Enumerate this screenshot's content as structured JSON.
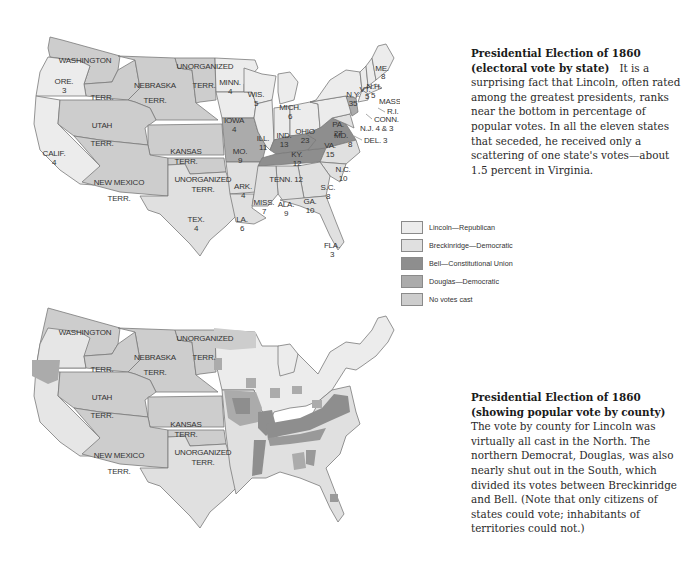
{
  "top_map": {
    "title": "Presidential Election of 1860 (electoral vote by state)",
    "caption_title": "Presidential Election of 1860 (electoral vote by state)",
    "caption_body": "It is a surprising fact that Lincoln, often rated among the greatest presidents, ranks near the bottom in percentage of popular votes. In all the eleven states that seceded, he received only a scattering of one state's votes—about 1.5 percent in Virginia.",
    "territories": [
      {
        "name": "WASHINGTON",
        "line2": "TERR."
      },
      {
        "name": "NEBRASKA",
        "line2": "TERR."
      },
      {
        "name": "UNORGANIZED",
        "line2": "TERR."
      },
      {
        "name": "UTAH",
        "line2": "TERR."
      },
      {
        "name": "KANSAS",
        "line2": "TERR."
      },
      {
        "name": "NEW MEXICO",
        "line2": "TERR."
      },
      {
        "name": "UNORGANIZED",
        "line2": "TERR."
      }
    ],
    "states": [
      {
        "abbr": "ORE.",
        "votes": "3",
        "winner": "Lincoln"
      },
      {
        "abbr": "CALIF.",
        "votes": "4",
        "winner": "Lincoln"
      },
      {
        "abbr": "MINN.",
        "votes": "4",
        "winner": "Lincoln"
      },
      {
        "abbr": "WIS.",
        "votes": "5",
        "winner": "Lincoln"
      },
      {
        "abbr": "IOWA",
        "votes": "4",
        "winner": "Lincoln"
      },
      {
        "abbr": "MICH.",
        "votes": "6",
        "winner": "Lincoln"
      },
      {
        "abbr": "ILL.",
        "votes": "11",
        "winner": "Lincoln"
      },
      {
        "abbr": "IND.",
        "votes": "13",
        "winner": "Lincoln"
      },
      {
        "abbr": "OHIO",
        "votes": "23",
        "winner": "Lincoln"
      },
      {
        "abbr": "PA.",
        "votes": "27",
        "winner": "Lincoln"
      },
      {
        "abbr": "N.Y.",
        "votes": "35",
        "winner": "Lincoln"
      },
      {
        "abbr": "VT.",
        "votes": "5",
        "winner": "Lincoln"
      },
      {
        "abbr": "N.H.",
        "votes": "5",
        "winner": "Lincoln"
      },
      {
        "abbr": "ME.",
        "votes": "8",
        "winner": "Lincoln"
      },
      {
        "abbr": "MASS.",
        "votes": "13",
        "winner": "Lincoln"
      },
      {
        "abbr": "R.I.",
        "votes": "4",
        "winner": "Lincoln"
      },
      {
        "abbr": "CONN.",
        "votes": "6",
        "winner": "Lincoln"
      },
      {
        "abbr": "N.J.",
        "votes": "4 & 3",
        "winner": "Lincoln/Douglas"
      },
      {
        "abbr": "DEL.",
        "votes": "3",
        "winner": "Breckinridge"
      },
      {
        "abbr": "MD.",
        "votes": "8",
        "winner": "Breckinridge"
      },
      {
        "abbr": "MO.",
        "votes": "9",
        "winner": "Douglas"
      },
      {
        "abbr": "KY.",
        "votes": "12",
        "winner": "Bell"
      },
      {
        "abbr": "VA.",
        "votes": "15",
        "winner": "Bell"
      },
      {
        "abbr": "TENN.",
        "votes": "12",
        "winner": "Bell"
      },
      {
        "abbr": "N.C.",
        "votes": "10",
        "winner": "Breckinridge"
      },
      {
        "abbr": "S.C.",
        "votes": "8",
        "winner": "Breckinridge"
      },
      {
        "abbr": "GA.",
        "votes": "10",
        "winner": "Breckinridge"
      },
      {
        "abbr": "ALA.",
        "votes": "9",
        "winner": "Breckinridge"
      },
      {
        "abbr": "MISS.",
        "votes": "7",
        "winner": "Breckinridge"
      },
      {
        "abbr": "LA.",
        "votes": "6",
        "winner": "Breckinridge"
      },
      {
        "abbr": "ARK.",
        "votes": "4",
        "winner": "Breckinridge"
      },
      {
        "abbr": "TEX.",
        "votes": "4",
        "winner": "Breckinridge"
      },
      {
        "abbr": "FLA.",
        "votes": "3",
        "winner": "Breckinridge"
      }
    ]
  },
  "legend": {
    "items": [
      {
        "label": "Lincoln—Republican",
        "color": "#ececec"
      },
      {
        "label": "Breckinridge—Democratic",
        "color": "#e0e0e0"
      },
      {
        "label": "Bell—Constitutional Union",
        "color": "#8e8e8e"
      },
      {
        "label": "Douglas—Democratic",
        "color": "#ababab"
      },
      {
        "label": "No votes cast",
        "color": "#cdcdcd"
      }
    ]
  },
  "bottom_map": {
    "caption_title": "Presidential Election of 1860 (showing popular vote by county)",
    "caption_body": "The vote by county for Lincoln was virtually all cast in the North. The northern Democrat, Douglas, was also nearly shut out in the South, which divided its votes between Breckinridge and Bell. (Note that only citizens of states could vote; inhabitants of territories could not.)",
    "territories": [
      {
        "name": "WASHINGTON",
        "line2": "TERR."
      },
      {
        "name": "NEBRASKA",
        "line2": "TERR."
      },
      {
        "name": "UNORGANIZED",
        "line2": "TERR."
      },
      {
        "name": "UTAH",
        "line2": "TERR."
      },
      {
        "name": "KANSAS",
        "line2": "TERR."
      },
      {
        "name": "NEW MEXICO",
        "line2": "TERR."
      },
      {
        "name": "UNORGANIZED",
        "line2": "TERR."
      }
    ]
  },
  "colors": {
    "lincoln": "#ececec",
    "breckinridge": "#e0e0e0",
    "bell": "#8e8e8e",
    "douglas": "#ababab",
    "no_votes": "#cdcdcd",
    "border": "#7a7a7a"
  }
}
